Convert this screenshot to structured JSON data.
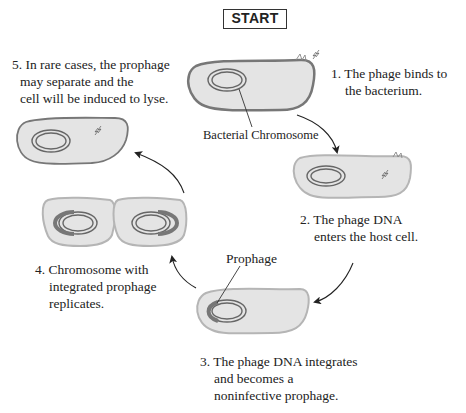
{
  "start_label": "START",
  "steps": [
    {
      "number": "1.",
      "lines": [
        "1. The phage binds to",
        "the bacterium."
      ]
    },
    {
      "number": "2.",
      "lines": [
        "2. The phage DNA",
        "enters the host cell."
      ]
    },
    {
      "number": "3.",
      "lines": [
        "3. The phage DNA integrates",
        "and becomes a",
        "noninfective prophage."
      ]
    },
    {
      "number": "4.",
      "lines": [
        "4. Chromosome with",
        "integrated prophage",
        "replicates."
      ]
    },
    {
      "number": "5.",
      "lines": [
        "5. In rare cases, the prophage",
        "may separate and the",
        "cell will be induced to lyse."
      ]
    }
  ],
  "labels": {
    "bacterial_chromosome": "Bacterial Chromosome",
    "prophage": "Prophage"
  },
  "colors": {
    "cell_fill": "#e4e4e4",
    "cell_outline_dark": "#777777",
    "cell_outline_light": "#b5b5b5",
    "prophage_segment": "#777777",
    "arrow": "#222222"
  }
}
